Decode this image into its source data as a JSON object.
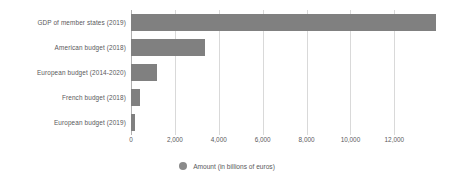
{
  "chart_data": {
    "type": "bar",
    "orientation": "horizontal",
    "title": "",
    "xlabel": "",
    "ylabel": "",
    "categories": [
      "GDP of member states (2019)",
      "American budget (2018)",
      "European budget (2014-2020)",
      "French budget (2018)",
      "European budget (2019)"
    ],
    "series": [
      {
        "name": "Amount (in billions of euros)",
        "color": "#808080",
        "values": [
          13900,
          3360,
          1180,
          390,
          166
        ]
      }
    ],
    "values": [
      13900,
      3360,
      1180,
      390,
      166
    ],
    "xlim": [
      0,
      14400
    ],
    "xticks": [
      0,
      2000,
      4000,
      6000,
      8000,
      10000,
      12000
    ],
    "xtick_labels": [
      "0",
      "2,000",
      "4,000",
      "6,000",
      "8,000",
      "10,000",
      "12,000"
    ],
    "grid": true,
    "legend": {
      "position": "bottom",
      "entries": [
        {
          "label": "Amount (in billions of euros)",
          "color": "#8a8a8a",
          "marker": "circle"
        }
      ]
    },
    "colors": {
      "bar": "#808080",
      "gridline": "#d9d9d9",
      "axis": "#b0b0b0",
      "text": "#59595b",
      "background": "#ffffff"
    }
  }
}
